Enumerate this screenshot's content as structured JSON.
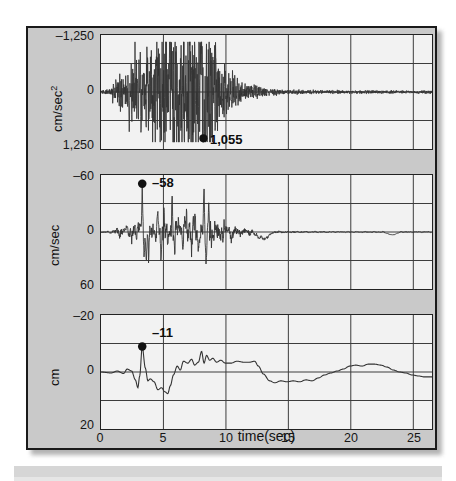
{
  "figure": {
    "kind": "seismogram",
    "background_color": "#c9c9c9",
    "plot_background_color": "#f2f2f2",
    "line_color": "#333333",
    "frame_color": "#1a1a1a",
    "x_axis_title": "time(sec)"
  },
  "chart_data": {
    "type": "line",
    "title": "",
    "xlabel": "time(sec)",
    "grid": true,
    "legend": null,
    "xlim": [
      0,
      26.5
    ],
    "xticks": [
      0,
      5,
      10,
      15,
      20,
      25
    ],
    "xticklabels": [
      "0",
      "5",
      "10",
      "15",
      "20",
      "25"
    ],
    "panels": [
      {
        "name": "acceleration",
        "ylabel": "cm/sec²",
        "ylabel_plain": "cm/sec2",
        "ylim": [
          -1250,
          1250
        ],
        "y_axis_inverted": true,
        "yticks": [
          -1250,
          0,
          1250
        ],
        "yticklabels": [
          "–1,250",
          "0",
          "1,250"
        ],
        "gridlines_y": [
          -625,
          0,
          625
        ],
        "peak": {
          "label": "1,055",
          "value": 1055,
          "time_sec": 8.2,
          "marker": "filled-circle"
        }
      },
      {
        "name": "velocity",
        "ylabel": "cm/sec",
        "ylabel_plain": "cm/sec",
        "ylim": [
          -60,
          60
        ],
        "y_axis_inverted": true,
        "yticks": [
          -60,
          0,
          60
        ],
        "yticklabels": [
          "–60",
          "0",
          "60"
        ],
        "gridlines_y": [
          -30,
          0,
          30
        ],
        "peak": {
          "label": "–58",
          "value": -58,
          "time_sec": 3.3,
          "marker": "filled-circle"
        }
      },
      {
        "name": "displacement",
        "ylabel": "cm",
        "ylabel_plain": "cm",
        "ylim": [
          -20,
          20
        ],
        "y_axis_inverted": true,
        "yticks": [
          -20,
          0,
          20
        ],
        "yticklabels": [
          "–20",
          "0",
          "20"
        ],
        "gridlines_y": [
          -10,
          0,
          10
        ],
        "peak": {
          "label": "–11",
          "value": -11,
          "time_sec": 3.3,
          "marker": "filled-circle"
        }
      }
    ]
  }
}
